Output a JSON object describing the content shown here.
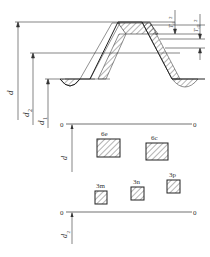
{
  "diagram": {
    "type": "thread-tolerance-zone-diagram",
    "profile_labels": {
      "major_diameter": "d",
      "pitch_diameter": "d",
      "pitch_diameter_sub": "2",
      "minor_diameter": "d",
      "minor_diameter_sub": "1"
    },
    "tolerance_labels": {
      "td": "T",
      "td_sub": "d",
      "td_denom": "2",
      "td2": "T",
      "td2_sub": "d2",
      "td2_denom": "2"
    },
    "zero_line_top": {
      "left": "0",
      "right": "0",
      "axis_label": "d"
    },
    "zero_line_bottom": {
      "left": "0",
      "right": "0",
      "axis_label": "d",
      "axis_label_sub": "2"
    },
    "zones_major": [
      {
        "label": "6e"
      },
      {
        "label": "6c"
      }
    ],
    "zones_pitch": [
      {
        "label": "3m"
      },
      {
        "label": "3n"
      },
      {
        "label": "3p"
      }
    ],
    "line_color": "#333333",
    "hatch_color": "#444444"
  }
}
